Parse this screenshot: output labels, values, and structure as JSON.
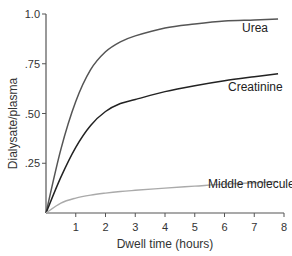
{
  "chart_data": {
    "type": "line",
    "title": "",
    "xlabel": "Dwell time (hours)",
    "ylabel": "Dialysate/plasma",
    "xlim": [
      0,
      8
    ],
    "ylim": [
      0,
      1.0
    ],
    "x_ticks": [
      "1",
      "2",
      "3",
      "4",
      "5",
      "6",
      "7",
      "8"
    ],
    "y_ticks": [
      ".25",
      ".50",
      ".75",
      "1.0"
    ],
    "grid": false,
    "legend": "inline labels at line ends",
    "x": [
      0,
      0.5,
      1,
      1.5,
      2,
      2.5,
      3,
      4,
      5,
      6,
      7,
      7.8
    ],
    "series": [
      {
        "name": "Urea",
        "color": "#555555",
        "values": [
          0,
          0.32,
          0.56,
          0.72,
          0.81,
          0.86,
          0.89,
          0.93,
          0.95,
          0.965,
          0.97,
          0.975
        ]
      },
      {
        "name": "Creatinine",
        "color": "#222222",
        "values": [
          0,
          0.18,
          0.33,
          0.44,
          0.51,
          0.55,
          0.57,
          0.61,
          0.64,
          0.665,
          0.685,
          0.7
        ]
      },
      {
        "name": "Middle molecule",
        "color": "#aaaaaa",
        "values": [
          0,
          0.05,
          0.075,
          0.09,
          0.1,
          0.108,
          0.114,
          0.125,
          0.135,
          0.145,
          0.152,
          0.158
        ]
      }
    ]
  }
}
